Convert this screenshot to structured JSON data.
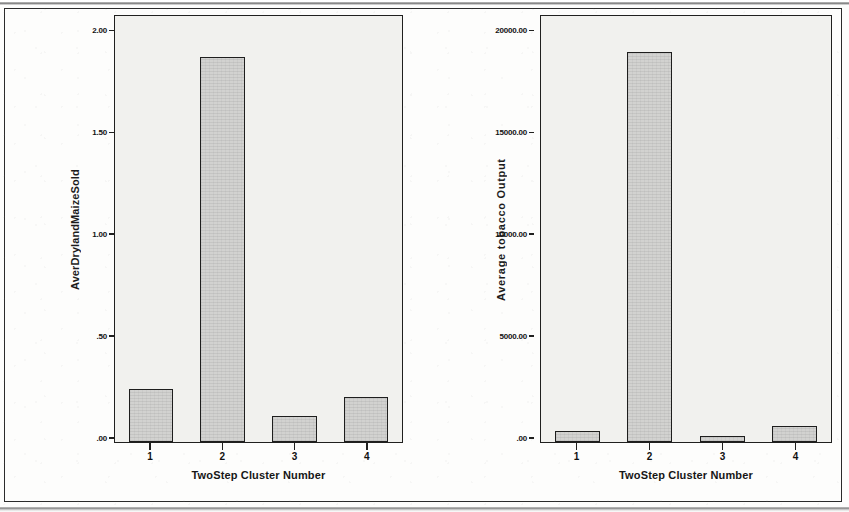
{
  "figure": {
    "background_color": "#fdfdfc",
    "frame_color": "#2b2b2b",
    "bar_fill_color": "#d2d2d0",
    "bar_border_color": "#1e1e1d",
    "panel_fill_color": "#f1f1ee"
  },
  "chart_data": [
    {
      "type": "bar",
      "id": "left",
      "title": "",
      "xlabel": "TwoStep Cluster Number",
      "ylabel": "AverDrylandMaizeSold",
      "categories": [
        "1",
        "2",
        "3",
        "4"
      ],
      "values": [
        0.26,
        1.9,
        0.13,
        0.22
      ],
      "ylim": [
        0,
        2.1
      ],
      "yticks": [
        0,
        0.5,
        1.0,
        1.5,
        2.0
      ],
      "ytick_labels": [
        ".00",
        ".50",
        "1.00",
        "1.50",
        "2.00"
      ],
      "grid": false,
      "legend": "none"
    },
    {
      "type": "bar",
      "id": "right",
      "title": "",
      "xlabel": "TwoStep Cluster Number",
      "ylabel": "Average tobacco Output",
      "categories": [
        "1",
        "2",
        "3",
        "4"
      ],
      "values": [
        540,
        19250,
        300,
        790
      ],
      "ylim": [
        0,
        21000
      ],
      "yticks": [
        0,
        5000,
        10000,
        15000,
        20000
      ],
      "ytick_labels": [
        ".00",
        "5000.00",
        "10000.00",
        "15000.00",
        "20000.00"
      ],
      "grid": false,
      "legend": "none"
    }
  ]
}
